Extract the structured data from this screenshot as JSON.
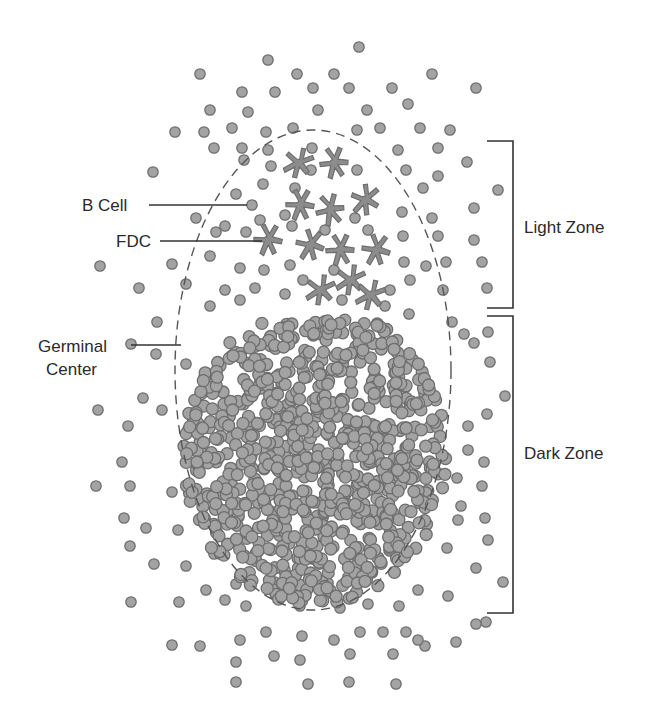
{
  "labels": {
    "b_cell": "B Cell",
    "fdc": "FDC",
    "germinal_line1": "Germinal",
    "germinal_line2": "Center",
    "light_zone": "Light Zone",
    "dark_zone": "Dark Zone"
  },
  "colors": {
    "cell_fill": "#a3a3a3",
    "cell_stroke": "#6e6e6e",
    "fdc_fill": "#8c8c8c",
    "line": "#333333",
    "dash": "#555555"
  },
  "germinal_center": {
    "cx": 313,
    "cy": 370,
    "rx": 138,
    "ry": 240
  },
  "dark_cluster": {
    "cx": 315,
    "cy": 455,
    "rx": 132,
    "ry": 150,
    "count": 900,
    "seed": 7
  },
  "fdcs": [
    [
      298,
      163
    ],
    [
      334,
      163
    ],
    [
      300,
      205
    ],
    [
      330,
      210
    ],
    [
      365,
      200
    ],
    [
      268,
      240
    ],
    [
      310,
      245
    ],
    [
      340,
      250
    ],
    [
      376,
      250
    ],
    [
      320,
      290
    ],
    [
      350,
      280
    ],
    [
      370,
      295
    ]
  ],
  "scatter_cells": [
    [
      359,
      47
    ],
    [
      268,
      60
    ],
    [
      200,
      74
    ],
    [
      297,
      74
    ],
    [
      334,
      74
    ],
    [
      432,
      74
    ],
    [
      242,
      92
    ],
    [
      275,
      92
    ],
    [
      313,
      88
    ],
    [
      349,
      88
    ],
    [
      392,
      88
    ],
    [
      476,
      88
    ],
    [
      210,
      110
    ],
    [
      248,
      112
    ],
    [
      318,
      110
    ],
    [
      367,
      110
    ],
    [
      408,
      104
    ],
    [
      175,
      132
    ],
    [
      204,
      132
    ],
    [
      232,
      128
    ],
    [
      266,
      132
    ],
    [
      293,
      128
    ],
    [
      357,
      130
    ],
    [
      380,
      128
    ],
    [
      420,
      128
    ],
    [
      450,
      130
    ],
    [
      214,
      148
    ],
    [
      242,
      148
    ],
    [
      268,
      150
    ],
    [
      312,
      148
    ],
    [
      398,
      150
    ],
    [
      438,
      148
    ],
    [
      467,
      162
    ],
    [
      153,
      172
    ],
    [
      244,
      160
    ],
    [
      271,
      166
    ],
    [
      311,
      170
    ],
    [
      357,
      170
    ],
    [
      406,
      170
    ],
    [
      438,
      176
    ],
    [
      263,
      184
    ],
    [
      295,
      188
    ],
    [
      423,
      188
    ],
    [
      498,
      190
    ],
    [
      236,
      194
    ],
    [
      252,
      205
    ],
    [
      285,
      215
    ],
    [
      355,
      218
    ],
    [
      402,
      212
    ],
    [
      432,
      218
    ],
    [
      474,
      208
    ],
    [
      196,
      218
    ],
    [
      225,
      226
    ],
    [
      260,
      220
    ],
    [
      216,
      232
    ],
    [
      246,
      232
    ],
    [
      292,
      226
    ],
    [
      325,
      230
    ],
    [
      368,
      230
    ],
    [
      403,
      236
    ],
    [
      438,
      236
    ],
    [
      474,
      240
    ],
    [
      100,
      266
    ],
    [
      139,
      288
    ],
    [
      172,
      264
    ],
    [
      210,
      256
    ],
    [
      240,
      268
    ],
    [
      264,
      270
    ],
    [
      290,
      265
    ],
    [
      334,
      270
    ],
    [
      404,
      262
    ],
    [
      426,
      266
    ],
    [
      446,
      262
    ],
    [
      482,
      262
    ],
    [
      186,
      284
    ],
    [
      225,
      290
    ],
    [
      255,
      288
    ],
    [
      285,
      294
    ],
    [
      303,
      280
    ],
    [
      342,
      300
    ],
    [
      390,
      290
    ],
    [
      410,
      280
    ],
    [
      443,
      290
    ],
    [
      487,
      288
    ],
    [
      157,
      322
    ],
    [
      210,
      306
    ],
    [
      240,
      300
    ],
    [
      385,
      306
    ],
    [
      409,
      314
    ],
    [
      452,
      322
    ],
    [
      464,
      334
    ],
    [
      488,
      332
    ],
    [
      131,
      344
    ],
    [
      156,
      354
    ],
    [
      186,
      364
    ],
    [
      474,
      343
    ],
    [
      490,
      362
    ],
    [
      505,
      396
    ],
    [
      487,
      414
    ],
    [
      468,
      426
    ],
    [
      98,
      410
    ],
    [
      143,
      398
    ],
    [
      128,
      426
    ],
    [
      162,
      410
    ],
    [
      468,
      450
    ],
    [
      484,
      462
    ],
    [
      457,
      478
    ],
    [
      122,
      462
    ],
    [
      96,
      486
    ],
    [
      130,
      486
    ],
    [
      172,
      492
    ],
    [
      482,
      486
    ],
    [
      461,
      506
    ],
    [
      485,
      518
    ],
    [
      124,
      518
    ],
    [
      146,
      528
    ],
    [
      178,
      530
    ],
    [
      458,
      520
    ],
    [
      488,
      540
    ],
    [
      447,
      548
    ],
    [
      130,
      546
    ],
    [
      154,
      564
    ],
    [
      186,
      566
    ],
    [
      214,
      554
    ],
    [
      236,
      584
    ],
    [
      476,
      568
    ],
    [
      503,
      582
    ],
    [
      131,
      602
    ],
    [
      179,
      602
    ],
    [
      206,
      590
    ],
    [
      225,
      600
    ],
    [
      246,
      606
    ],
    [
      275,
      582
    ],
    [
      300,
      606
    ],
    [
      340,
      608
    ],
    [
      368,
      604
    ],
    [
      399,
      606
    ],
    [
      418,
      590
    ],
    [
      448,
      596
    ],
    [
      486,
      622
    ],
    [
      172,
      645
    ],
    [
      200,
      646
    ],
    [
      240,
      640
    ],
    [
      266,
      632
    ],
    [
      302,
      636
    ],
    [
      334,
      640
    ],
    [
      360,
      632
    ],
    [
      383,
      632
    ],
    [
      406,
      632
    ],
    [
      425,
      646
    ],
    [
      456,
      642
    ],
    [
      476,
      624
    ],
    [
      236,
      662
    ],
    [
      274,
      656
    ],
    [
      300,
      660
    ],
    [
      350,
      654
    ],
    [
      393,
      654
    ],
    [
      418,
      640
    ],
    [
      236,
      682
    ],
    [
      308,
      684
    ],
    [
      349,
      682
    ],
    [
      396,
      684
    ]
  ],
  "leaders": {
    "b_cell": {
      "x1": 149,
      "y1": 205,
      "x2": 247,
      "y2": 205
    },
    "fdc": {
      "x1": 160,
      "y1": 241,
      "x2": 262,
      "y2": 241
    },
    "germinal": {
      "x1": 131,
      "y1": 345,
      "x2": 181,
      "y2": 345
    }
  },
  "brackets": {
    "light_zone": {
      "x": 513,
      "top": 141,
      "bottom": 308
    },
    "dark_zone": {
      "x": 513,
      "top": 316,
      "bottom": 613
    }
  }
}
